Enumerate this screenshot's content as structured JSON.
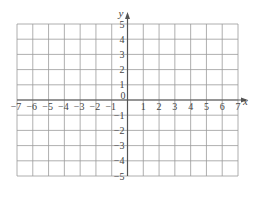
{
  "chart_data": {
    "type": "grid",
    "title": "",
    "xlabel": "x",
    "ylabel": "y",
    "xlim": [
      -7,
      7
    ],
    "ylim": [
      -5,
      5
    ],
    "grid": true,
    "origin_label": "0",
    "x_ticks": [
      -7,
      -6,
      -5,
      -4,
      -3,
      -2,
      -1,
      1,
      2,
      3,
      4,
      5,
      6,
      7
    ],
    "y_ticks": [
      -5,
      -4,
      -3,
      -2,
      -1,
      1,
      2,
      3,
      4,
      5
    ],
    "x_tick_labels": [
      "−7",
      "−6",
      "−5",
      "−4",
      "−3",
      "−2",
      "−1",
      "1",
      "2",
      "3",
      "4",
      "5",
      "6",
      "7"
    ],
    "y_tick_labels": [
      "−5",
      "−4",
      "−3",
      "−2",
      "−1",
      "1",
      "2",
      "3",
      "4",
      "5"
    ],
    "series": []
  },
  "colors": {
    "grid": "#9a9a9a",
    "axis": "#555555",
    "text": "#444444",
    "background": "#ffffff"
  }
}
